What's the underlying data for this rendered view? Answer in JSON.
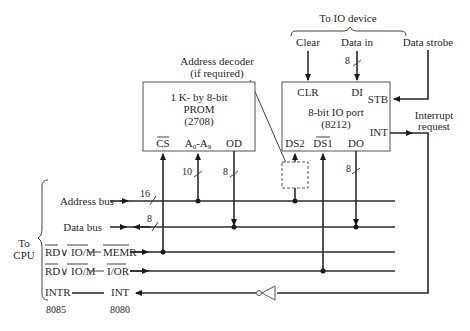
{
  "diagram": {
    "top_label": "To IO device",
    "io_inputs": [
      "Clear",
      "Data in",
      "Data strobe"
    ],
    "decoder_label_line1": "Address decoder",
    "decoder_label_line2": "(if required)",
    "prom": {
      "line1": "1 K- by 8-bit",
      "line2": "PROM",
      "line3": "(2708)",
      "pins": {
        "cs": "CS",
        "addr": "A0-A9",
        "addr_main": "A",
        "addr_sub0": "0",
        "addr_mid": "-A",
        "addr_sub9": "9",
        "od": "OD"
      }
    },
    "io_port": {
      "line1": "8-bit IO port",
      "line2": "(8212)",
      "pins": {
        "clr": "CLR",
        "di": "DI",
        "stb": "STB",
        "int": "INT",
        "ds2": "DS2",
        "ds1": "DS1",
        "do": "DO"
      }
    },
    "interrupt_request_line1": "Interrupt",
    "interrupt_request_line2": "request",
    "bus_widths": {
      "address": "16",
      "data": "8",
      "prom_addr": "10",
      "prom_od": "8",
      "data_in": "8",
      "io_do": "8"
    },
    "cpu": {
      "label_line1": "To",
      "label_line2": "CPU",
      "address_bus": "Address bus",
      "data_bus": "Data bus",
      "rd_io_m_a": "RD∨ IO/M",
      "memr": "MEMR",
      "rd_io_m_b": "RD∨ IO/M",
      "ior": "I/OR",
      "intr": "INTR",
      "int": "INT",
      "cpu_8085": "8085",
      "cpu_8080": "8080"
    }
  }
}
